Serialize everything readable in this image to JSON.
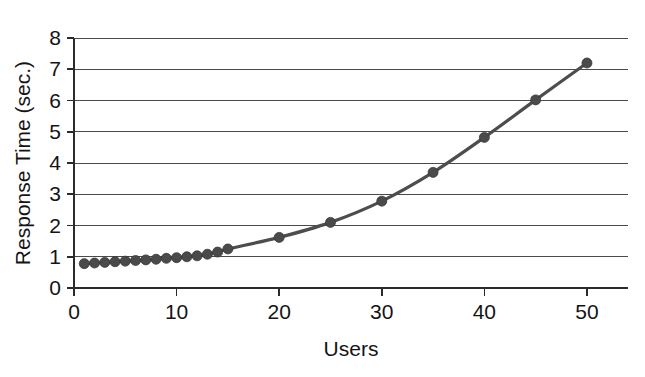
{
  "chart_data": {
    "type": "line",
    "title": "",
    "xlabel": "Users",
    "ylabel": "Response Time (sec.)",
    "xlim": [
      0,
      54
    ],
    "ylim": [
      0,
      8
    ],
    "xticks": [
      0,
      10,
      20,
      30,
      40,
      50
    ],
    "yticks": [
      0,
      1,
      2,
      3,
      4,
      5,
      6,
      7,
      8
    ],
    "grid": "horizontal",
    "legend": "none",
    "series": [
      {
        "name": "Response Time",
        "color": "#4a4a4a",
        "marker": "filled-circle",
        "x": [
          1,
          2,
          3,
          4,
          5,
          6,
          7,
          8,
          9,
          10,
          11,
          12,
          13,
          14,
          15,
          20,
          25,
          30,
          35,
          40,
          45,
          50
        ],
        "y": [
          0.78,
          0.8,
          0.82,
          0.84,
          0.86,
          0.88,
          0.9,
          0.92,
          0.95,
          0.97,
          1.0,
          1.03,
          1.08,
          1.15,
          1.25,
          1.62,
          2.1,
          2.78,
          3.7,
          4.82,
          6.02,
          7.2
        ]
      }
    ]
  },
  "axes": {
    "y_tick_labels": [
      "0",
      "1",
      "2",
      "3",
      "4",
      "5",
      "6",
      "7",
      "8"
    ],
    "x_tick_labels": [
      "0",
      "10",
      "20",
      "30",
      "40",
      "50"
    ],
    "x_axis_title": "Users",
    "y_axis_title": "Response Time (sec.)"
  },
  "colors": {
    "series": "#4a4a4a",
    "grid": "#4a4a4a",
    "axis": "#2b2b2b",
    "text": "#141414",
    "background": "#ffffff"
  }
}
